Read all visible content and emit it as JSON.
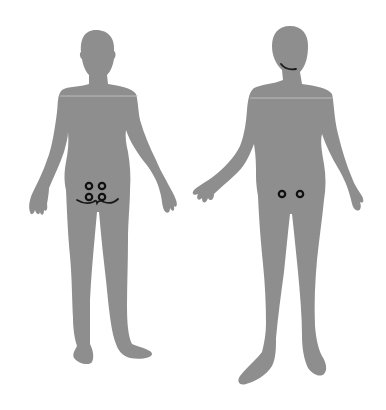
{
  "diagram": {
    "type": "body-map",
    "background": "#ffffff",
    "body_color": "#8e8e8e",
    "marker_color": "#111111",
    "figures": [
      {
        "id": "figure-left",
        "view": "posterior",
        "markers": [
          {
            "shape": "circle",
            "x": 89,
            "y": 186
          },
          {
            "shape": "circle",
            "x": 102,
            "y": 186
          },
          {
            "shape": "circle",
            "x": 89,
            "y": 197
          },
          {
            "shape": "circle",
            "x": 102,
            "y": 197
          }
        ],
        "lines": [
          {
            "shape": "wavy-curve",
            "from_x": 77,
            "to_x": 118,
            "y": 201
          }
        ]
      },
      {
        "id": "figure-right",
        "view": "posterior-turned",
        "markers": [
          {
            "shape": "circle",
            "x": 282,
            "y": 194
          },
          {
            "shape": "circle",
            "x": 300,
            "y": 194
          }
        ],
        "lines": [
          {
            "shape": "curve",
            "from_x": 281,
            "to_x": 296,
            "y": 67,
            "location": "neck"
          }
        ]
      }
    ]
  }
}
